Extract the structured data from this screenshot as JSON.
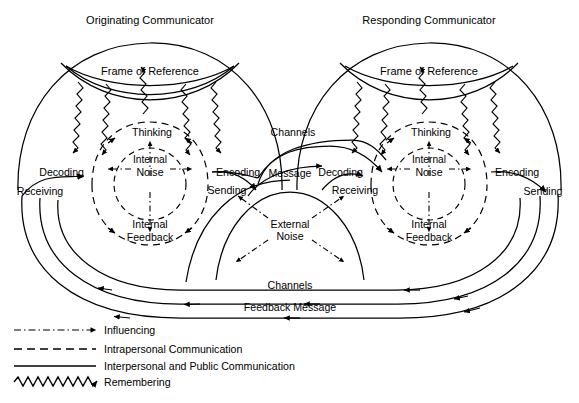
{
  "diagram": {
    "title_left": "Originating Communicator",
    "title_right": "Responding Communicator",
    "frame_of_reference": "Frame of Reference",
    "thinking": "Thinking",
    "internal": "Internal",
    "noise": "Noise",
    "decoding": "Decoding",
    "encoding": "Encoding",
    "internal_feedback_1": "Internal",
    "internal_feedback_2": "Feedback",
    "receiving": "Receiving",
    "sending": "Sending",
    "message": "Message",
    "channels_top": "Channels",
    "channels_bottom": "Channels",
    "feedback_message": "Feedback  Message",
    "external_noise_1": "External",
    "external_noise_2": "Noise"
  },
  "legend": {
    "items": [
      {
        "label": "Influencing",
        "style": "dash-dot-arrow",
        "color": "#000000"
      },
      {
        "label": "Intrapersonal Communication",
        "style": "dashed",
        "color": "#000000"
      },
      {
        "label": "Interpersonal and Public Communication",
        "style": "solid",
        "color": "#000000"
      },
      {
        "label": "Remembering",
        "style": "wavy-arrow",
        "color": "#000000"
      }
    ]
  },
  "colors": {
    "ink": "#000000",
    "background": "#ffffff"
  }
}
